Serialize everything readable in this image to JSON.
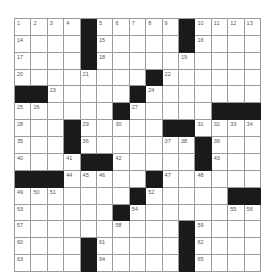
{
  "puzzle": {
    "rows": 15,
    "cols": 15,
    "colors": {
      "block": "#1a1a1a",
      "cell": "#ffffff",
      "line": "#9a9a9a",
      "number": "#555555"
    },
    "layout": [
      "1,2,3,4,#,5,6,7,8,9,#,10,11,12,13",
      "14,.,.,.,#,15,.,.,.,.,#,16,.,.,.",
      "17,.,.,.,#,18,.,.,.,.,19,.,.,.,.",
      "20,.,.,.,21,.,.,.,#,22,.,.,.,.,.",
      "#,#,23,.,.,.,.,#,24,.,.,.,.,.,.",
      "25,26,.,.,.,.,#,27,.,.,.,.,#,#,#",
      "28,.,.,#,29,.,30,.,.,#,#,31,32,33,34",
      "35,.,.,#,36,.,.,.,.,37,38,#,39,.,.",
      "40,.,.,41,#,#,42,.,.,.,.,#,43,.,.",
      "#,#,#,44,45,46,.,.,#,47,.,48,.,.,.",
      "49,50,51,.,.,.,.,#,52,.,.,.,.,#,#",
      "53,.,.,.,.,.,#,54,.,.,.,.,.,55,56",
      "57,.,.,.,.,.,58,.,.,.,#,59,.,.,.",
      "60,.,.,.,#,61,.,.,.,.,#,62,.,.,.",
      "63,.,.,.,#,64,.,.,.,.,#,65,.,.,."
    ]
  }
}
